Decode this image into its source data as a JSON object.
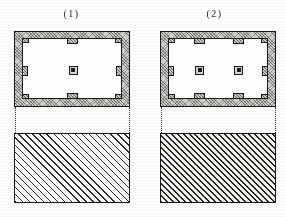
{
  "figure_title": "",
  "figures": [
    {
      "label": "(1)",
      "plan": {
        "name": "single-column-hall-plan",
        "wall_fill": "#cfcdc8",
        "line_color": "#1a1a1a",
        "room_fill": "#ffffff",
        "pilasters_top": 1,
        "pilasters_bottom": 1,
        "pilasters_left": 1,
        "pilasters_right": 1,
        "interior_columns": 1
      },
      "block": {
        "name": "section-block-light",
        "hatch": "diagonal-45",
        "density": "light"
      }
    },
    {
      "label": "(2)",
      "plan": {
        "name": "two-column-hall-plan",
        "wall_fill": "#cfcdc8",
        "line_color": "#1a1a1a",
        "room_fill": "#ffffff",
        "pilasters_top": 2,
        "pilasters_bottom": 2,
        "pilasters_left": 1,
        "pilasters_right": 1,
        "interior_columns": 2
      },
      "block": {
        "name": "section-block-dark",
        "hatch": "diagonal-45",
        "density": "dense"
      }
    }
  ],
  "colors": {
    "paper": "#fdfdfb",
    "ink": "#1a1a1a",
    "masonry": "#cfcdc8",
    "hatch": "#2a2a2a"
  }
}
